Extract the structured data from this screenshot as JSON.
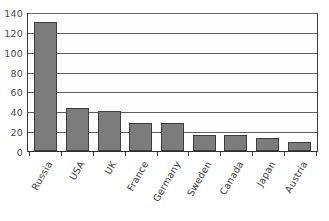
{
  "chart_data": {
    "type": "bar",
    "title": "",
    "subtitle": "",
    "xlabel": "",
    "ylabel": "",
    "categories": [
      "Russia",
      "USA",
      "UK",
      "France",
      "Germany",
      "Sweden",
      "Canada",
      "Japan",
      "Austria"
    ],
    "values": [
      130,
      43,
      40,
      28,
      28,
      16,
      16,
      13,
      9
    ],
    "series": [
      {
        "name": "",
        "values": [
          130,
          43,
          40,
          28,
          28,
          16,
          16,
          13,
          9
        ]
      }
    ],
    "ylim": [
      0,
      140
    ],
    "yticks": [
      0,
      20,
      40,
      60,
      80,
      100,
      120,
      140
    ],
    "ytick_labels": [
      "0",
      "20",
      "40",
      "60",
      "80",
      "100",
      "120",
      "140"
    ],
    "grid": true,
    "grid_axis": "y",
    "legend": false,
    "legend_position": "none",
    "bar_color": "#7c7c7c",
    "bar_edge_color": "#3d3d3d",
    "axis_color": "#3a3a3a",
    "grid_color": "#5c5c5c",
    "background_color": "#ffffff",
    "xtick_label_rotation": -60
  }
}
